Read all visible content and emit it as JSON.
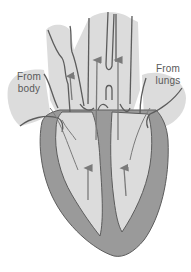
{
  "diagram": {
    "labels": {
      "from_body": {
        "line1": "From",
        "line2": "body"
      },
      "from_lungs": {
        "line1": "From",
        "line2": "lungs"
      }
    },
    "colors": {
      "background": "#ffffff",
      "chamber_fill": "#dcdcdc",
      "muscle_fill": "#9a9a9a",
      "outline": "#5c5c5c",
      "arrow": "#7a7a7a",
      "label_text": "#5a5a5a"
    },
    "arrows": [
      {
        "name": "arrow-right-atrium-up",
        "direction": "up"
      },
      {
        "name": "arrow-pulmonary-artery-up",
        "direction": "up"
      },
      {
        "name": "arrow-aorta-up",
        "direction": "up"
      },
      {
        "name": "arrow-right-ventricle-up",
        "direction": "up"
      },
      {
        "name": "arrow-left-ventricle-up",
        "direction": "up"
      }
    ]
  }
}
